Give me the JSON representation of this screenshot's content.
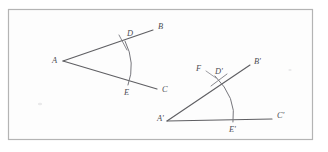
{
  "figure": {
    "frame": {
      "border_color": "#b4b4b4",
      "background_color": "#fdfdfd",
      "x": 8,
      "y": 9,
      "width": 305,
      "height": 131
    },
    "ink_color": "#5f5f63",
    "arc_color": "#76767c",
    "label_color": "#4e4e54",
    "original_angle": {
      "name": "angle-BAC",
      "vertex": {
        "label": "A",
        "x": 63,
        "y": 61,
        "label_x": 52,
        "label_y": 61
      },
      "points": [
        {
          "label": "B",
          "x": 153,
          "y": 30,
          "label_x": 158,
          "label_y": 27
        },
        {
          "label": "C",
          "x": 157,
          "y": 89,
          "label_x": 162,
          "label_y": 90
        },
        {
          "label": "D",
          "x": 125,
          "y": 41,
          "label_x": 127,
          "label_y": 34
        },
        {
          "label": "E",
          "x": 128,
          "y": 85,
          "label_x": 124,
          "label_y": 92
        }
      ],
      "rays": [
        {
          "name": "ray-AB",
          "x1": 63,
          "y1": 61,
          "x2": 153,
          "y2": 30
        },
        {
          "name": "ray-AC",
          "x1": 63,
          "y1": 61,
          "x2": 157,
          "y2": 89
        }
      ],
      "arc": {
        "name": "arc-DE",
        "path": "M 125 41 Q 136 63 128 85"
      },
      "tick": {
        "name": "tick-at-D",
        "x1": 119,
        "y1": 35,
        "x2": 127,
        "y2": 50
      }
    },
    "copied_angle": {
      "name": "angle-B-prime-A-prime-C-prime",
      "vertex": {
        "label": "A'",
        "x": 167,
        "y": 121,
        "label_x": 157,
        "label_y": 119
      },
      "points": [
        {
          "label": "B'",
          "x": 250,
          "y": 65,
          "label_x": 254,
          "label_y": 62
        },
        {
          "label": "C'",
          "x": 272,
          "y": 119,
          "label_x": 277,
          "label_y": 116
        },
        {
          "label": "D'",
          "x": 219,
          "y": 80,
          "label_x": 215,
          "label_y": 73
        },
        {
          "label": "E'",
          "x": 233,
          "y": 120,
          "label_x": 230,
          "label_y": 128
        },
        {
          "label": "F",
          "x": 203,
          "y": 70,
          "label_x": 198,
          "label_y": 69
        }
      ],
      "rays": [
        {
          "name": "ray-A-prime-B-prime",
          "x1": 167,
          "y1": 121,
          "x2": 250,
          "y2": 65
        },
        {
          "name": "ray-A-prime-C-prime",
          "x1": 167,
          "y1": 121,
          "x2": 272,
          "y2": 119
        }
      ],
      "arc": {
        "name": "arc-D-prime-E-prime",
        "path": "M 215 76 Q 237 98 233 122"
      },
      "tick": {
        "name": "tick-at-D-prime",
        "x1": 211,
        "y1": 86,
        "x2": 227,
        "y2": 74
      },
      "leader": {
        "name": "leader-F-to-D-prime",
        "x1": 206,
        "y1": 71,
        "x2": 216,
        "y2": 78
      }
    }
  }
}
